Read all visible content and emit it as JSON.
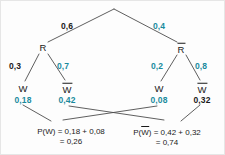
{
  "diagram": {
    "type": "probability-tree",
    "decimal_separator": ",",
    "colors": {
      "accent_teal": "#1a8b9e",
      "text_dark": "#1a1a1a",
      "line": "#4d4d4d",
      "background": "#fdfdfd"
    }
  },
  "nodes": {
    "root": {
      "label": "",
      "x": 113,
      "y": 8
    },
    "level1": [
      {
        "id": "R",
        "label": "R",
        "overbar": false,
        "x": 42,
        "y": 47
      },
      {
        "id": "Rbar",
        "label": "R",
        "overbar": true,
        "x": 180,
        "y": 48
      }
    ],
    "level2": [
      {
        "id": "R-W",
        "label": "W",
        "overbar": false,
        "x": 22,
        "y": 88
      },
      {
        "id": "R-Wbar",
        "label": "W",
        "overbar": true,
        "x": 66,
        "y": 88
      },
      {
        "id": "Rbar-W",
        "label": "W",
        "overbar": false,
        "x": 158,
        "y": 88
      },
      {
        "id": "Rbar-Wbar",
        "label": "W",
        "overbar": true,
        "x": 201,
        "y": 88
      }
    ]
  },
  "branch_probabilities": {
    "root_to_R": {
      "value": "0,6",
      "color": "dark",
      "x": 66,
      "y": 25
    },
    "root_to_Rbar": {
      "value": "0,4",
      "color": "teal",
      "x": 158,
      "y": 25
    },
    "R_to_W": {
      "value": "0,3",
      "color": "dark",
      "x": 14,
      "y": 65
    },
    "R_to_Wbar": {
      "value": "0,7",
      "color": "teal",
      "x": 62,
      "y": 65
    },
    "Rbar_to_W": {
      "value": "0,2",
      "color": "teal",
      "x": 156,
      "y": 65
    },
    "Rbar_to_Wbar": {
      "value": "0,8",
      "color": "teal",
      "x": 200,
      "y": 65
    }
  },
  "leaf_values": {
    "R_W": {
      "value": "0,18",
      "color": "teal",
      "x": 22,
      "y": 99
    },
    "R_Wbar": {
      "value": "0,42",
      "color": "teal",
      "x": 66,
      "y": 99
    },
    "Rbar_W": {
      "value": "0,08",
      "color": "teal",
      "x": 158,
      "y": 99
    },
    "Rbar_Wbar": {
      "value": "0,32",
      "color": "dark",
      "x": 201,
      "y": 99
    }
  },
  "results": {
    "left": {
      "id": "P-W",
      "prefix": "P(",
      "symbol": "W",
      "overbar": false,
      "suffix": ") = ",
      "sum_expression": "0,18 + 0,08",
      "equals_line": "= 0,26",
      "total": "0,26",
      "x": 70,
      "y": 126
    },
    "right": {
      "id": "P-Wbar",
      "prefix": "P(",
      "symbol": "W",
      "overbar": true,
      "suffix": ") = ",
      "sum_expression": "0,42 + 0,32",
      "equals_line": "= 0,74",
      "total": "0,74",
      "x": 166,
      "y": 126
    }
  }
}
